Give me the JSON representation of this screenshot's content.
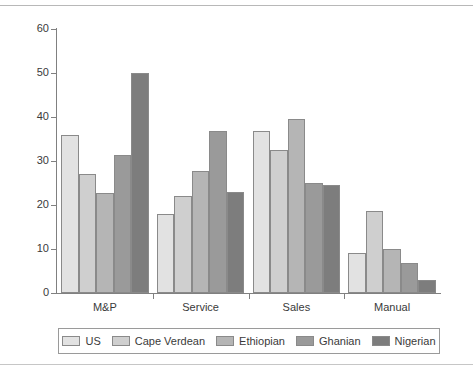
{
  "chart_data": {
    "type": "bar",
    "title": "",
    "xlabel": "",
    "ylabel": "",
    "categories": [
      "M&P",
      "Service",
      "Sales",
      "Manual"
    ],
    "series": [
      {
        "name": "US",
        "color": "#e2e2e2",
        "values": [
          36.0,
          18.0,
          36.8,
          9.0
        ]
      },
      {
        "name": "Cape Verdean",
        "color": "#cfcfcf",
        "values": [
          27.0,
          22.0,
          32.4,
          18.6
        ]
      },
      {
        "name": "Ethiopian",
        "color": "#b5b5b5",
        "values": [
          22.7,
          27.7,
          39.6,
          10.0
        ]
      },
      {
        "name": "Ghanian",
        "color": "#9a9a9a",
        "values": [
          31.3,
          36.8,
          25.0,
          6.8
        ]
      },
      {
        "name": "Nigerian",
        "color": "#7d7d7d",
        "values": [
          50.0,
          23.0,
          24.5,
          3.0
        ]
      }
    ],
    "ylim": [
      0,
      60
    ],
    "yticks": [
      0,
      10,
      20,
      30,
      40,
      50,
      60
    ],
    "ytick_labels": [
      "0",
      "10",
      "20",
      "30",
      "40",
      "50",
      "60"
    ],
    "grid": false,
    "legend_position": "bottom",
    "axis_color": "#808080",
    "bar_edge_color": "#8a8a8a",
    "text_color": "#3a3a3a",
    "background": "#ffffff"
  }
}
